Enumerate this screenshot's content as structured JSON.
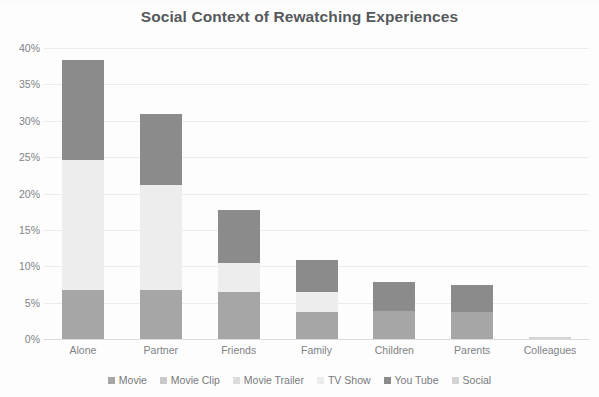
{
  "chart_data": {
    "type": "bar",
    "subtype": "stacked-column",
    "title": "Social Context of Rewatching Experiences",
    "xlabel": "",
    "ylabel": "",
    "ylim": [
      0,
      40
    ],
    "ytick_values": [
      0,
      5,
      10,
      15,
      20,
      25,
      30,
      35,
      40
    ],
    "ytick_labels": [
      "0%",
      "5%",
      "10%",
      "15%",
      "20%",
      "25%",
      "30%",
      "35%",
      "40%"
    ],
    "grid": true,
    "legend_position": "bottom",
    "categories": [
      "Alone",
      "Partner",
      "Friends",
      "Family",
      "Children",
      "Parents",
      "Colleagues"
    ],
    "series": [
      {
        "name": "Movie",
        "color": "#a6a6a6",
        "values": [
          6.7,
          6.8,
          6.5,
          3.7,
          3.9,
          3.7,
          0.0
        ]
      },
      {
        "name": "Movie Clip",
        "color": "#c9c9c9",
        "values": [
          0.0,
          0.0,
          0.0,
          0.0,
          0.0,
          0.0,
          0.0
        ]
      },
      {
        "name": "Movie Trailer",
        "color": "#ededed",
        "values": [
          17.9,
          14.4,
          4.0,
          2.7,
          0.0,
          0.0,
          0.0
        ]
      },
      {
        "name": "TV Show",
        "color": "#f2f2f2",
        "values": [
          0.0,
          0.0,
          0.0,
          0.0,
          0.0,
          0.0,
          0.0
        ]
      },
      {
        "name": "You Tube",
        "color": "#8b8b8b",
        "values": [
          13.7,
          9.8,
          7.3,
          4.5,
          3.9,
          3.7,
          0.0
        ]
      },
      {
        "name": "Social",
        "color": "#d4d4d4",
        "values": [
          0.0,
          0.0,
          0.0,
          0.0,
          0.0,
          0.0,
          0.3
        ]
      }
    ],
    "totals": [
      38.3,
      31.0,
      17.8,
      10.9,
      7.8,
      7.4,
      0.3
    ]
  },
  "legend": {
    "items": [
      {
        "label": "Movie",
        "color": "#a6a6a6",
        "icon": "legend-swatch-icon"
      },
      {
        "label": "Movie Clip",
        "color": "#c9c9c9",
        "icon": "legend-swatch-icon"
      },
      {
        "label": "Movie Trailer",
        "color": "#dcdcdc",
        "icon": "legend-swatch-icon"
      },
      {
        "label": "TV Show",
        "color": "#ececec",
        "icon": "legend-swatch-icon"
      },
      {
        "label": "You Tube",
        "color": "#8b8b8b",
        "icon": "legend-swatch-icon"
      },
      {
        "label": "Social",
        "color": "#d4d4d4",
        "icon": "legend-swatch-icon"
      }
    ]
  },
  "colors": {
    "title": "#56595c",
    "tick_text": "#808386",
    "gridline": "#ececec",
    "background": "#fdfdfd"
  }
}
